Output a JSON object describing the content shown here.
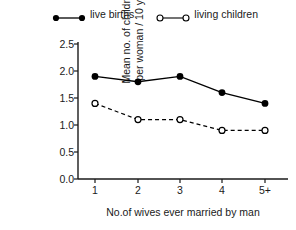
{
  "chart_data": {
    "type": "line",
    "title": "",
    "xlabel": "No.of wives ever married by man",
    "ylabel": "Mean no. of children per woman / 10 yrs",
    "ylabel_lines": [
      "Mean no. of children",
      "per woman / 10 yrs"
    ],
    "categories": [
      "1",
      "2",
      "3",
      "4",
      "5+"
    ],
    "ylim": [
      0.0,
      2.5
    ],
    "yticks": [
      "2.5",
      "2.0",
      "1.5",
      "1.0",
      "0.5",
      "0.0"
    ],
    "ytick_values": [
      2.5,
      2.0,
      1.5,
      1.0,
      0.5,
      0.0
    ],
    "grid": false,
    "legend_position": "top",
    "series": [
      {
        "name": "live births",
        "values": [
          1.9,
          1.8,
          1.9,
          1.6,
          1.4
        ],
        "marker": "filled-circle",
        "linestyle": "solid",
        "color": "#000000"
      },
      {
        "name": "living children",
        "values": [
          1.4,
          1.1,
          1.1,
          0.9,
          0.9
        ],
        "marker": "open-circle",
        "linestyle": "dashed",
        "color": "#000000"
      }
    ]
  },
  "legend": {
    "entries": [
      {
        "label": "live births",
        "marker": "filled-circle-icon"
      },
      {
        "label": "living children",
        "marker": "open-circle-icon"
      }
    ]
  },
  "axes": {
    "y_title_line1": "Mean no. of children",
    "y_title_line2": "per woman / 10 yrs",
    "x_title": "No.of wives ever married by man",
    "y_ticks": [
      "2.5",
      "2.0",
      "1.5",
      "1.0",
      "0.5",
      "0.0"
    ],
    "x_ticks": [
      "1",
      "2",
      "3",
      "4",
      "5+"
    ]
  },
  "colors": {
    "ink": "#000000",
    "text": "#1a1a1a",
    "background": "#ffffff"
  }
}
